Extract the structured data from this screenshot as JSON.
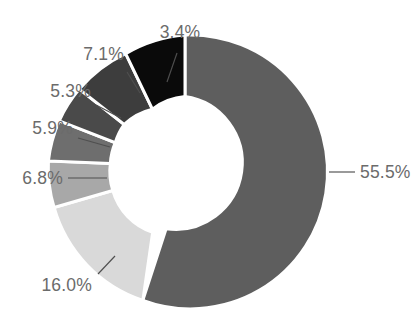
{
  "chart_data": {
    "type": "pie",
    "variant": "donut",
    "title": "",
    "subtitle": "",
    "xlabel": "",
    "ylabel": "",
    "legend": false,
    "legend_position": "none",
    "grid": false,
    "value_format": "percent_one_decimal",
    "start_angle_deg": 0,
    "direction": "clockwise",
    "inner_radius_ratio": 0.555,
    "categories": [
      "Slice 1",
      "Slice 2",
      "Slice 3",
      "Slice 4",
      "Slice 5",
      "Slice 6",
      "Slice 7"
    ],
    "values": [
      55.5,
      16.0,
      6.8,
      5.9,
      5.3,
      7.1,
      3.4
    ],
    "labels": [
      "55.5%",
      "16.0%",
      "6.8%",
      "5.9%",
      "5.3%",
      "7.1%",
      "3.4%"
    ],
    "colors": [
      "#5e5e5e",
      "#d9d9d9",
      "#a8a8a8",
      "#6e6e6e",
      "#4a4a4a",
      "#3d3d3d",
      "#0a0a0a"
    ],
    "total": 100.0,
    "slice_separator_color": "#ffffff",
    "label_color": "#6b6b6b",
    "leader_line_color": "#4f4f4f",
    "background_color": "#ffffff"
  },
  "slices": [
    {
      "id": "slice-55-5",
      "label": "55.5%",
      "value": 55.5,
      "color": "#5e5e5e",
      "path": "M 185 35 A 137 137 0 1 1 142.83 300.34 L 166.11 228.69 A 61.6 61.6 0 1 0 185 96.6 Z",
      "leader": "M 329 172 L 355 172",
      "label_x": 360,
      "label_y": 178,
      "anchor": "start"
    },
    {
      "id": "slice-16-0",
      "label": "16.0%",
      "value": 16.0,
      "color": "#d9d9d9",
      "path": "M 142.83 300.34 A 137 137 0 0 1 54.12 207.52 L 112.78 190.53 A 61.6 61.6 0 0 0 152.67 232.26 Z",
      "leader": "M 115 256 L 98 274",
      "label_x": 92,
      "label_y": 291,
      "anchor": "end"
    },
    {
      "id": "slice-6-8",
      "label": "6.8%",
      "value": 6.8,
      "color": "#a8a8a8",
      "path": "M 54.12 207.52 A 137 137 0 0 1 48.42 160.91 L 110.33 163.40 A 61.6 61.6 0 0 0 112.78 190.53 Z",
      "leader": "M 107 178 L 68 178",
      "label_x": 63,
      "label_y": 184,
      "anchor": "end"
    },
    {
      "id": "slice-5-9",
      "label": "5.9%",
      "value": 5.9,
      "color": "#6e6e6e",
      "path": "M 48.42 160.91 A 137 137 0 0 1 59.25 120.79 L 115.23 142.69 A 61.6 61.6 0 0 0 110.33 163.40 Z",
      "leader": "M 110 147 L 78 138",
      "label_x": 73,
      "label_y": 134,
      "anchor": "end"
    },
    {
      "id": "slice-5-3",
      "label": "5.3%",
      "value": 5.3,
      "color": "#4a4a4a",
      "path": "M 59.25 120.79 A 137 137 0 0 1 79.32 89.12 L 124.22 124.45 A 61.6 61.6 0 0 0 115.23 142.69 Z",
      "leader": "M 121 118 L 96 105",
      "label_x": 91,
      "label_y": 97,
      "anchor": "end"
    },
    {
      "id": "slice-7-1",
      "label": "7.1%",
      "value": 7.1,
      "color": "#3d3d3d",
      "path": "M 79.32 89.12 A 137 137 0 0 1 125.68 53.70 L 152.44 109.23 A 61.6 61.6 0 0 0 124.22 124.45 Z",
      "leader": "M 140 93 L 127 72",
      "label_x": 124,
      "label_y": 60,
      "anchor": "end"
    },
    {
      "id": "slice-3-4",
      "label": "3.4%",
      "value": 3.4,
      "color": "#0a0a0a",
      "path": "M 125.68 53.70 A 137 137 0 0 1 185 35 L 185 96.6 A 61.6 61.6 0 0 0 152.44 109.23 Z",
      "leader": "M 167 82 L 177 53",
      "label_x": 180,
      "label_y": 38,
      "anchor": "middle"
    }
  ]
}
